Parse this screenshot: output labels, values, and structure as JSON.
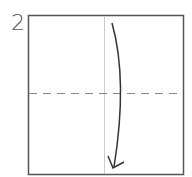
{
  "diagram": {
    "step_number": "2",
    "paper": {
      "x": 28,
      "y": 15,
      "width": 156,
      "height": 160,
      "stroke": "#555555"
    },
    "crease_line": {
      "x": 104,
      "y1": 15,
      "y2": 175,
      "color": "#cccccc"
    },
    "valley_fold_line": {
      "y": 93,
      "x1": 28,
      "x2": 184,
      "style": "dashed",
      "color": "#888888"
    },
    "fold_arrow": {
      "direction": "down",
      "color": "#333333"
    }
  }
}
